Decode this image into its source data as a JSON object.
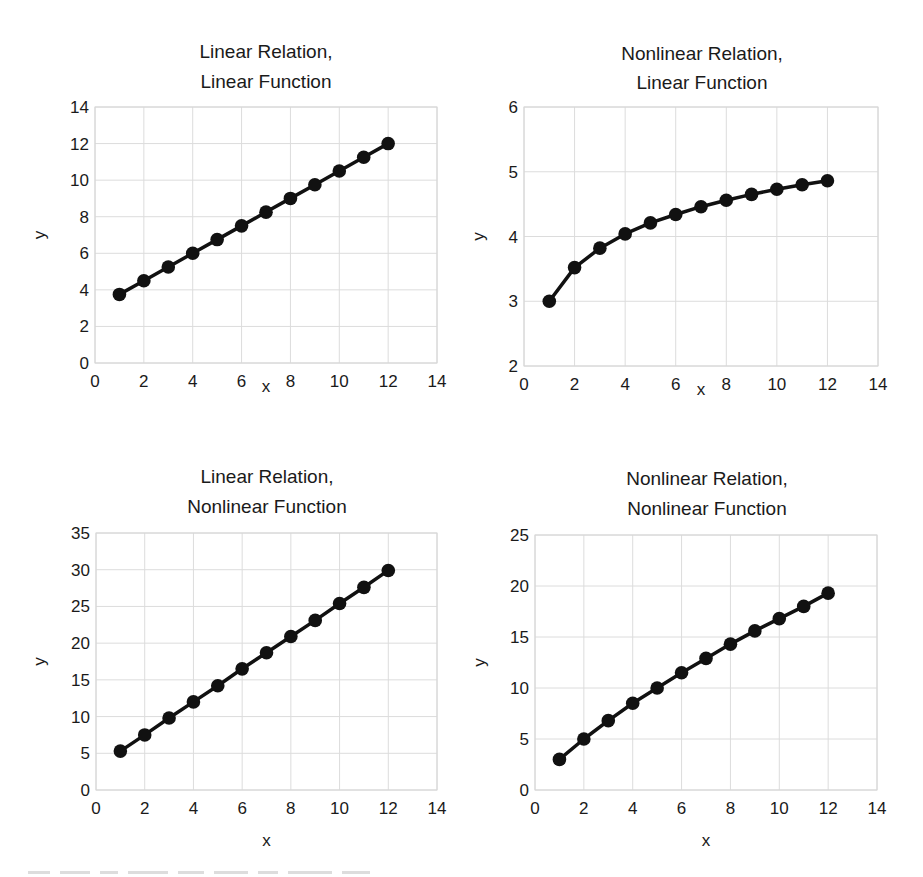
{
  "chart_data": [
    {
      "type": "line",
      "title": "Linear Relation, Linear Function",
      "title_lines": [
        "Linear Relation,",
        "Linear Function"
      ],
      "xlabel": "x",
      "ylabel": "y",
      "xlim": [
        0,
        14
      ],
      "ylim": [
        0,
        14
      ],
      "xticks": [
        0,
        2,
        4,
        6,
        8,
        10,
        12,
        14
      ],
      "yticks": [
        0,
        2,
        4,
        6,
        8,
        10,
        12,
        14
      ],
      "grid": true,
      "legend": null,
      "series": [
        {
          "name": "y",
          "x": [
            1,
            2,
            3,
            4,
            5,
            6,
            7,
            8,
            9,
            10,
            11,
            12
          ],
          "values": [
            3.75,
            4.5,
            5.25,
            6.0,
            6.75,
            7.5,
            8.25,
            9.0,
            9.75,
            10.5,
            11.25,
            12.0
          ]
        }
      ]
    },
    {
      "type": "line",
      "title": "Nonlinear Relation, Linear Function",
      "title_lines": [
        "Nonlinear Relation,",
        "Linear Function"
      ],
      "xlabel": "x",
      "ylabel": "y",
      "xlim": [
        0,
        14
      ],
      "ylim": [
        2,
        6
      ],
      "xticks": [
        0,
        2,
        4,
        6,
        8,
        10,
        12,
        14
      ],
      "yticks": [
        2,
        3,
        4,
        5,
        6
      ],
      "grid": true,
      "legend": null,
      "series": [
        {
          "name": "y",
          "x": [
            1,
            2,
            3,
            4,
            5,
            6,
            7,
            8,
            9,
            10,
            11,
            12
          ],
          "values": [
            3.0,
            3.52,
            3.82,
            4.04,
            4.21,
            4.34,
            4.46,
            4.56,
            4.65,
            4.73,
            4.8,
            4.86
          ]
        }
      ]
    },
    {
      "type": "line",
      "title": "Linear Relation, Nonlinear Function",
      "title_lines": [
        "Linear Relation,",
        "Nonlinear Function"
      ],
      "xlabel": "x",
      "ylabel": "y",
      "xlim": [
        0,
        14
      ],
      "ylim": [
        0,
        35
      ],
      "xticks": [
        0,
        2,
        4,
        6,
        8,
        10,
        12,
        14
      ],
      "yticks": [
        0,
        5,
        10,
        15,
        20,
        25,
        30,
        35
      ],
      "grid": true,
      "legend": null,
      "series": [
        {
          "name": "y",
          "x": [
            1,
            2,
            3,
            4,
            5,
            6,
            7,
            8,
            9,
            10,
            11,
            12
          ],
          "values": [
            5.3,
            7.5,
            9.8,
            12.0,
            14.2,
            16.5,
            18.7,
            20.9,
            23.1,
            25.4,
            27.6,
            29.9
          ]
        }
      ]
    },
    {
      "type": "line",
      "title": "Nonlinear Relation, Nonlinear Function",
      "title_lines": [
        "Nonlinear Relation,",
        "Nonlinear Function"
      ],
      "xlabel": "x",
      "ylabel": "y",
      "xlim": [
        0,
        14
      ],
      "ylim": [
        0,
        25
      ],
      "xticks": [
        0,
        2,
        4,
        6,
        8,
        10,
        12,
        14
      ],
      "yticks": [
        0,
        5,
        10,
        15,
        20,
        25
      ],
      "grid": true,
      "legend": null,
      "series": [
        {
          "name": "y",
          "x": [
            1,
            2,
            3,
            4,
            5,
            6,
            7,
            8,
            9,
            10,
            11,
            12
          ],
          "values": [
            3.0,
            5.0,
            6.8,
            8.5,
            10.0,
            11.5,
            12.9,
            14.3,
            15.6,
            16.8,
            18.0,
            19.3
          ]
        }
      ]
    }
  ]
}
